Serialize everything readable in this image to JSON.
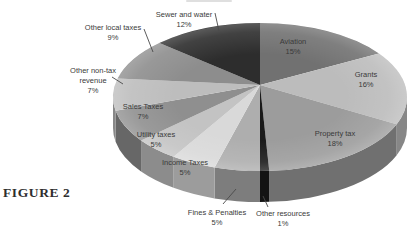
{
  "figure_label": "FIGURE 2",
  "chart_data": {
    "type": "pie",
    "style": "3d",
    "title": "",
    "direction": "clockwise",
    "start_angle_deg": 0,
    "total": 100,
    "legend_position": "none",
    "label_color": "#3a3a3a",
    "leader_color": "#4a4a4a",
    "background": "#ffffff",
    "categories": [
      "Aviation",
      "Grants",
      "Property tax",
      "Other resources",
      "Fines & Penalties",
      "Income Taxes",
      "Utility taxes",
      "Sales Taxes",
      "Other non-tax revenue",
      "Other local taxes",
      "Sewer and water"
    ],
    "values": [
      15,
      16,
      18,
      1,
      5,
      5,
      5,
      7,
      7,
      9,
      12
    ],
    "slices": [
      {
        "name": "Aviation",
        "value": 15,
        "pct_label": "15%",
        "color": "#717171",
        "label_lines": [
          "Aviation",
          "15%"
        ],
        "label_x": 293,
        "label_y": 37,
        "leader": null
      },
      {
        "name": "Grants",
        "value": 16,
        "pct_label": "16%",
        "color": "#bcbcbc",
        "label_lines": [
          "Grants",
          "16%"
        ],
        "label_x": 366,
        "label_y": 70,
        "leader": null
      },
      {
        "name": "Property tax",
        "value": 18,
        "pct_label": "18%",
        "color": "#9c9c9c",
        "label_lines": [
          "Property tax",
          "18%"
        ],
        "label_x": 335,
        "label_y": 129,
        "leader": null
      },
      {
        "name": "Other resources",
        "value": 1,
        "pct_label": "1%",
        "color": "#1a1a1a",
        "label_lines": [
          "Other resources",
          "1%"
        ],
        "label_x": 283,
        "label_y": 209,
        "leader": [
          263,
          196,
          268,
          207
        ]
      },
      {
        "name": "Fines & Penalties",
        "value": 5,
        "pct_label": "5%",
        "color": "#aeaeae",
        "label_lines": [
          "Fines & Penalties",
          "5%"
        ],
        "label_x": 217,
        "label_y": 208,
        "leader": [
          236,
          189,
          223,
          204
        ]
      },
      {
        "name": "Income Taxes",
        "value": 5,
        "pct_label": "5%",
        "color": "#d9d9d9",
        "label_lines": [
          "Income Taxes",
          "5%"
        ],
        "label_x": 185,
        "label_y": 158,
        "leader": null
      },
      {
        "name": "Utility taxes",
        "value": 5,
        "pct_label": "5%",
        "color": "#c3c3c3",
        "label_lines": [
          "Utility taxes",
          "5%"
        ],
        "label_x": 156,
        "label_y": 130,
        "leader": null
      },
      {
        "name": "Sales Taxes",
        "value": 7,
        "pct_label": "7%",
        "color": "#8f8f8f",
        "label_lines": [
          "Sales Taxes",
          "7%"
        ],
        "label_x": 143,
        "label_y": 102,
        "leader": null
      },
      {
        "name": "Other non-tax revenue",
        "value": 7,
        "pct_label": "7%",
        "color": "#bdbdbd",
        "label_lines": [
          "Other non-tax",
          "revenue",
          "7%"
        ],
        "label_x": 93,
        "label_y": 66,
        "leader": [
          112,
          77,
          123,
          84
        ]
      },
      {
        "name": "Other local taxes",
        "value": 9,
        "pct_label": "9%",
        "color": "#8d8d8d",
        "label_lines": [
          "Other local taxes",
          "9%"
        ],
        "label_x": 113,
        "label_y": 23,
        "leader": [
          144,
          29,
          153,
          52
        ]
      },
      {
        "name": "Sewer and water",
        "value": 12,
        "pct_label": "12%",
        "color": "#2d2d2d",
        "label_lines": [
          "Sewer and water",
          "12%"
        ],
        "label_x": 184,
        "label_y": 10,
        "leader": [
          215,
          13,
          219,
          31
        ]
      }
    ],
    "geometry": {
      "cx": 260,
      "cy": 97,
      "rx": 147,
      "ry": 74,
      "depth": 31,
      "apex_lift": 12,
      "side_shade": 0.72
    }
  }
}
